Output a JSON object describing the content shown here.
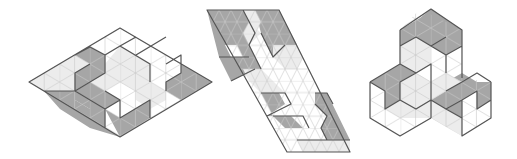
{
  "figures": [
    {
      "id": "rhombus",
      "label": "Rhombus tiling",
      "shape": "isometric rhombus 6x6",
      "outline": [
        [
          29,
          82
        ],
        [
          120,
          28
        ],
        [
          212,
          82
        ],
        [
          120,
          137
        ]
      ]
    },
    {
      "id": "parallelogram",
      "label": "Parallelogram tiling",
      "shape": "slanted parallelogram",
      "outline": [
        [
          207,
          10
        ],
        [
          279,
          10
        ],
        [
          350,
          152
        ],
        [
          287,
          152
        ]
      ]
    },
    {
      "id": "hexagonal-cluster",
      "label": "Three-cube cluster tiling",
      "shape": "isometric stacked cubes",
      "outline": [
        [
          420,
          9
        ],
        [
          462,
          30
        ],
        [
          462,
          78
        ],
        [
          491,
          82
        ],
        [
          491,
          118
        ],
        [
          462,
          136
        ],
        [
          431,
          118
        ],
        [
          400,
          136
        ],
        [
          370,
          118
        ],
        [
          370,
          82
        ],
        [
          400,
          64
        ],
        [
          400,
          30
        ]
      ]
    }
  ],
  "colors": {
    "dark": "#a6a6a6",
    "light": "#ececec",
    "white": "#ffffff",
    "grid": "#c4c4c4",
    "edge": "#555555"
  }
}
